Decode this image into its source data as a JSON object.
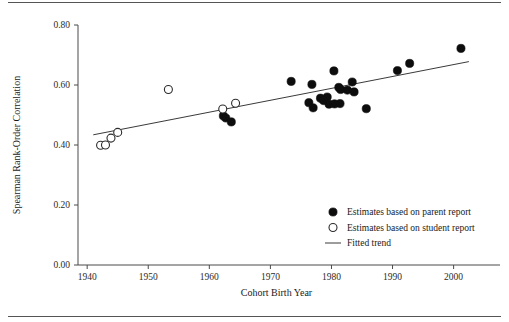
{
  "figure": {
    "background_color": "#ffffff",
    "rule_color": "#555555",
    "has_top_rule": true,
    "has_bottom_rule": true
  },
  "chart_data": {
    "type": "scatter",
    "title": "",
    "subtitle": "",
    "xlabel": "Cohort Birth Year",
    "ylabel": "Spearman Rank-Order Correlation",
    "xlim": [
      1938.5,
      2003.5
    ],
    "ylim": [
      0.0,
      0.8
    ],
    "xticks": [
      1940,
      1950,
      1960,
      1970,
      1980,
      1990,
      2000
    ],
    "xtick_labels": [
      "1940",
      "1950",
      "1960",
      "1970",
      "1980",
      "1990",
      "2000"
    ],
    "yticks": [
      0.0,
      0.2,
      0.4,
      0.6,
      0.8
    ],
    "ytick_labels": [
      "0.00",
      "0.20",
      "0.40",
      "0.60",
      "0.80"
    ],
    "grid": false,
    "legend_position": "lower-right",
    "marker_colors": {
      "parent_report": "#0d0d0d",
      "student_report": "#ffffff",
      "student_report_edge": "#2b2b2b",
      "fitted_trend": "#3a3a3a"
    },
    "series": [
      {
        "name": "Estimates based on parent report",
        "marker": "filled-circle",
        "points": [
          {
            "x": 1962.3,
            "y": 0.497
          },
          {
            "x": 1962.7,
            "y": 0.49
          },
          {
            "x": 1963.6,
            "y": 0.477
          },
          {
            "x": 1973.4,
            "y": 0.612
          },
          {
            "x": 1976.8,
            "y": 0.602
          },
          {
            "x": 1976.3,
            "y": 0.541
          },
          {
            "x": 1977.0,
            "y": 0.524
          },
          {
            "x": 1978.2,
            "y": 0.556
          },
          {
            "x": 1978.7,
            "y": 0.548
          },
          {
            "x": 1979.3,
            "y": 0.56
          },
          {
            "x": 1979.6,
            "y": 0.536
          },
          {
            "x": 1980.4,
            "y": 0.647
          },
          {
            "x": 1980.5,
            "y": 0.537
          },
          {
            "x": 1981.2,
            "y": 0.592
          },
          {
            "x": 1981.5,
            "y": 0.585
          },
          {
            "x": 1981.4,
            "y": 0.538
          },
          {
            "x": 1982.6,
            "y": 0.583
          },
          {
            "x": 1983.4,
            "y": 0.61
          },
          {
            "x": 1983.7,
            "y": 0.577
          },
          {
            "x": 1985.7,
            "y": 0.521
          },
          {
            "x": 1990.8,
            "y": 0.648
          },
          {
            "x": 1992.8,
            "y": 0.672
          },
          {
            "x": 2001.2,
            "y": 0.722
          }
        ]
      },
      {
        "name": "Estimates based on student report",
        "marker": "open-circle",
        "points": [
          {
            "x": 1942.2,
            "y": 0.399
          },
          {
            "x": 1943.0,
            "y": 0.4
          },
          {
            "x": 1943.9,
            "y": 0.423
          },
          {
            "x": 1945.0,
            "y": 0.442
          },
          {
            "x": 1953.3,
            "y": 0.585
          },
          {
            "x": 1962.2,
            "y": 0.52
          },
          {
            "x": 1964.3,
            "y": 0.539
          }
        ]
      }
    ],
    "fitted_trend": {
      "name": "Fitted trend",
      "style": "solid-line",
      "x_start": 1941.0,
      "y_start": 0.434,
      "x_end": 2002.5,
      "y_end": 0.678
    }
  },
  "legend": {
    "items": [
      {
        "marker": "filled-circle",
        "label": "Estimates based on parent report"
      },
      {
        "marker": "open-circle",
        "label": "Estimates based on student report"
      },
      {
        "marker": "line",
        "label": "Fitted trend"
      }
    ]
  }
}
